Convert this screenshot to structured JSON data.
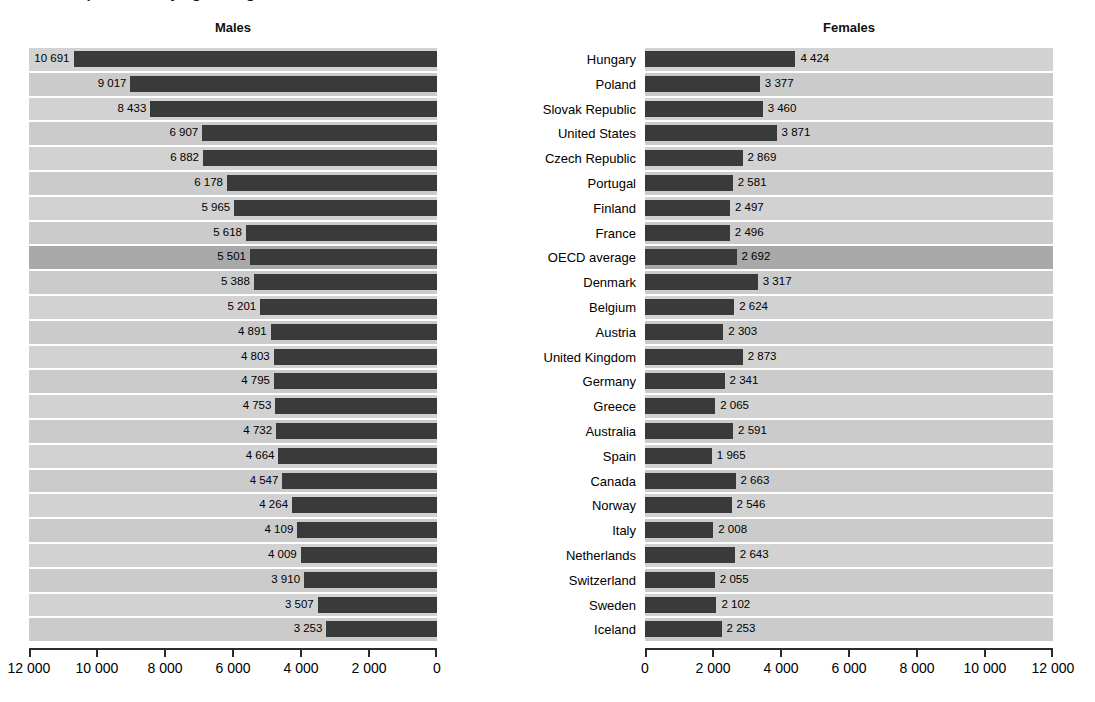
{
  "page": {
    "title_fragment": "Health expenditure by age and gender",
    "left_panel_label": "Males",
    "right_panel_label": "Females"
  },
  "axis": {
    "left_ticks": [
      "12 000",
      "10 000",
      "8 000",
      "6 000",
      "4 000",
      "2 000",
      "0"
    ],
    "right_ticks": [
      "0",
      "2 000",
      "4 000",
      "6 000",
      "8 000",
      "10 000",
      "12 000"
    ],
    "max": 12000,
    "min": 0,
    "tick_step": 2000
  },
  "colors": {
    "bar": "#3a3a3a",
    "plot_background": "#d2d2d2",
    "plot_background_alt": "#cbcbcb",
    "highlight_row": "#a9a9a9",
    "gridline": "#ffffff",
    "axis": "#2b2b2b",
    "text": "#000000"
  },
  "chart_data": {
    "type": "bar",
    "title": "Health expenditure by age and gender",
    "xlabel": "",
    "ylabel": "",
    "orientation": "horizontal",
    "layout": "back-to-back population pyramid, two panels sharing category axis",
    "xlim": [
      0,
      12000
    ],
    "xticks": [
      0,
      2000,
      4000,
      6000,
      8000,
      10000,
      12000
    ],
    "grid": true,
    "legend": false,
    "highlight_category": "OECD average",
    "categories": [
      "Hungary",
      "Poland",
      "Slovak Republic",
      "United States",
      "Czech Republic",
      "Portugal",
      "Finland",
      "France",
      "OECD average",
      "Denmark",
      "Belgium",
      "Austria",
      "United Kingdom",
      "Germany",
      "Greece",
      "Australia",
      "Spain",
      "Canada",
      "Norway",
      "Italy",
      "Netherlands",
      "Switzerland",
      "Sweden",
      "Iceland"
    ],
    "series": [
      {
        "name": "Males",
        "panel": "left",
        "direction": "right-to-left",
        "values": [
          10691,
          9017,
          8433,
          6907,
          6882,
          6178,
          5965,
          5618,
          5501,
          5388,
          5201,
          4891,
          4803,
          4795,
          4753,
          4732,
          4664,
          4547,
          4264,
          4109,
          4009,
          3910,
          3507,
          3253
        ],
        "labels": [
          "10 691",
          "9 017",
          "8 433",
          "6 907",
          "6 882",
          "6 178",
          "5 965",
          "5 618",
          "5 501",
          "5 388",
          "5 201",
          "4 891",
          "4 803",
          "4 795",
          "4 753",
          "4 732",
          "4 664",
          "4 547",
          "4 264",
          "4 109",
          "4 009",
          "3 910",
          "3 507",
          "3 253"
        ]
      },
      {
        "name": "Females",
        "panel": "right",
        "direction": "left-to-right",
        "values": [
          4424,
          3377,
          3460,
          3871,
          2869,
          2581,
          2497,
          2496,
          2692,
          3317,
          2624,
          2303,
          2873,
          2341,
          2065,
          2591,
          1965,
          2663,
          2546,
          2008,
          2643,
          2055,
          2102,
          2253
        ],
        "labels": [
          "4 424",
          "3 377",
          "3 460",
          "3 871",
          "2 869",
          "2 581",
          "2 497",
          "2 496",
          "2 692",
          "3 317",
          "2 624",
          "2 303",
          "2 873",
          "2 341",
          "2 065",
          "2 591",
          "1 965",
          "2 663",
          "2 546",
          "2 008",
          "2 643",
          "2 055",
          "2 102",
          "2 253"
        ]
      }
    ]
  }
}
